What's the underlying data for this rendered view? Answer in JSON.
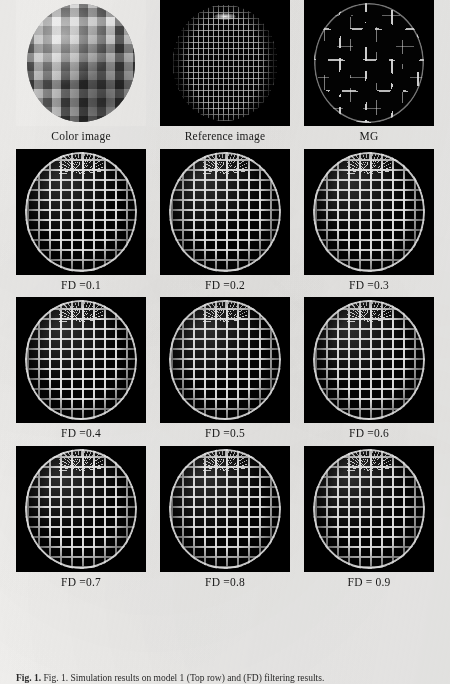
{
  "figure": {
    "background_color": "#f2f1ef",
    "panel_background": "#000000",
    "first_panel_background": "#f5f4f2",
    "mesh_color": "#f5f5f5",
    "caption": "Fig. 1. Simulation results on model 1 (Top row) and (FD) filtering results.",
    "caption_label": "Fig. 1.",
    "rows": [
      {
        "cells": [
          {
            "label": "Color image",
            "kind": "color-sphere",
            "name": "panel-color-image"
          },
          {
            "label": "Reference image",
            "kind": "wireframe-sphere",
            "name": "panel-reference-image"
          },
          {
            "label": "MG",
            "kind": "contour-sphere",
            "name": "panel-mg"
          }
        ]
      },
      {
        "cells": [
          {
            "label": "FD =0.1",
            "kind": "fd-sphere",
            "name": "panel-fd-01"
          },
          {
            "label": "FD =0.2",
            "kind": "fd-sphere",
            "name": "panel-fd-02"
          },
          {
            "label": "FD =0.3",
            "kind": "fd-sphere",
            "name": "panel-fd-03"
          }
        ]
      },
      {
        "cells": [
          {
            "label": "FD =0.4",
            "kind": "fd-sphere",
            "name": "panel-fd-04"
          },
          {
            "label": "FD =0.5",
            "kind": "fd-sphere",
            "name": "panel-fd-05"
          },
          {
            "label": "FD =0.6",
            "kind": "fd-sphere",
            "name": "panel-fd-06"
          }
        ]
      },
      {
        "cells": [
          {
            "label": "FD =0.7",
            "kind": "fd-sphere",
            "name": "panel-fd-07"
          },
          {
            "label": "FD =0.8",
            "kind": "fd-sphere",
            "name": "panel-fd-08"
          },
          {
            "label": "FD = 0.9",
            "kind": "fd-sphere",
            "name": "panel-fd-09"
          }
        ]
      }
    ]
  }
}
